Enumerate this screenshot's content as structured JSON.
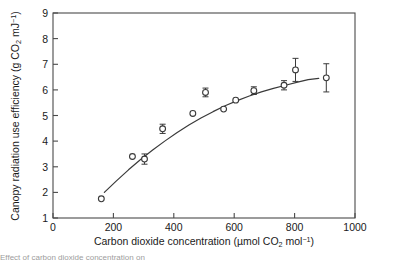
{
  "chart_data": {
    "type": "scatter",
    "title": "",
    "xlabel": "Carbon dioxide concentration (µmol CO₂ mol⁻¹)",
    "ylabel": "Canopy radiation use efficiency (g CO₂ mJ⁻¹)",
    "xlim": [
      0,
      1000
    ],
    "ylim": [
      1,
      9
    ],
    "xticks": [
      0,
      200,
      400,
      600,
      800,
      1000
    ],
    "yticks": [
      1,
      2,
      3,
      4,
      5,
      6,
      7,
      8,
      9
    ],
    "xtick_labels": [
      "0",
      "200",
      "400",
      "600",
      "800",
      "1000"
    ],
    "ytick_labels": [
      "1",
      "2",
      "3",
      "4",
      "5",
      "6",
      "7",
      "8",
      "9"
    ],
    "grid": false,
    "legend": null,
    "marker_style": "open-circle",
    "points": [
      {
        "x": 160,
        "y": 1.75,
        "yerr": 0.0
      },
      {
        "x": 263,
        "y": 3.4,
        "yerr": 0.0
      },
      {
        "x": 303,
        "y": 3.3,
        "yerr": 0.2
      },
      {
        "x": 363,
        "y": 4.48,
        "yerr": 0.18
      },
      {
        "x": 463,
        "y": 5.08,
        "yerr": 0.0
      },
      {
        "x": 505,
        "y": 5.9,
        "yerr": 0.17
      },
      {
        "x": 565,
        "y": 5.25,
        "yerr": 0.0
      },
      {
        "x": 605,
        "y": 5.6,
        "yerr": 0.0
      },
      {
        "x": 665,
        "y": 5.97,
        "yerr": 0.15
      },
      {
        "x": 765,
        "y": 6.18,
        "yerr": 0.18
      },
      {
        "x": 803,
        "y": 6.78,
        "yerr": 0.45
      },
      {
        "x": 905,
        "y": 6.47,
        "yerr": 0.55
      }
    ],
    "fit_curve": {
      "label": "fitted saturating response",
      "x": [
        170,
        210,
        250,
        290,
        330,
        370,
        410,
        450,
        490,
        530,
        570,
        610,
        650,
        690,
        730,
        770,
        810,
        845,
        880
      ],
      "y": [
        2.0,
        2.45,
        2.88,
        3.28,
        3.65,
        4.0,
        4.33,
        4.63,
        4.9,
        5.15,
        5.38,
        5.58,
        5.76,
        5.92,
        6.06,
        6.18,
        6.3,
        6.4,
        6.45
      ]
    },
    "annotations": []
  },
  "caption": {
    "text": "Effect of carbon dioxide concentration on"
  }
}
